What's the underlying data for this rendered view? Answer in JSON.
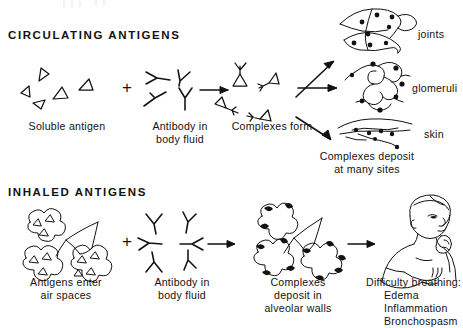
{
  "figure": {
    "ink_color": "#14110f",
    "background": "#ffffff",
    "width": 463,
    "height": 328
  },
  "sections": [
    {
      "id": "circulating",
      "heading": "CIRCULATING ANTIGENS",
      "steps": [
        {
          "id": "soluble-antigen",
          "caption": "Soluble antigen",
          "icon": "triangle-antigen-cluster",
          "count": 5
        },
        {
          "id": "operator-plus",
          "caption": "+",
          "icon": "plus-operator"
        },
        {
          "id": "antibody",
          "caption": "Antibody in\nbody fluid",
          "caption_line1": "Antibody in",
          "caption_line2": "body fluid",
          "icon": "y-antibody-cluster",
          "count": 4
        },
        {
          "id": "complexes",
          "caption": "Complexes form",
          "icon": "antigen-antibody-complex-cluster",
          "count": 4
        }
      ],
      "outcomes": [
        {
          "id": "joints",
          "label": "joints",
          "icon": "joint-space-deposits"
        },
        {
          "id": "glomeruli",
          "label": "glomeruli",
          "icon": "glomerulus-deposits"
        },
        {
          "id": "skin",
          "label": "skin",
          "icon": "skin-vessel-deposits"
        }
      ],
      "outcome_caption_line1": "Complexes deposit",
      "outcome_caption_line2": "at many sites"
    },
    {
      "id": "inhaled",
      "heading": "INHALED ANTIGENS",
      "steps": [
        {
          "id": "antigens-air-spaces",
          "caption_line1": "Antigens enter",
          "caption_line2": "air spaces",
          "icon": "alveoli-with-antigens"
        },
        {
          "id": "operator-plus-2",
          "caption": "+",
          "icon": "plus-operator"
        },
        {
          "id": "antibody-2",
          "caption_line1": "Antibody in",
          "caption_line2": "body fluid",
          "icon": "y-antibody-radial-cluster",
          "count": 6
        },
        {
          "id": "alveolar-deposits",
          "caption_line1": "Complexes",
          "caption_line2": "deposit in",
          "caption_line3": "alveolar walls",
          "icon": "alveoli-with-deposits"
        },
        {
          "id": "symptoms",
          "icon": "coughing-patient"
        }
      ],
      "symptoms": {
        "title": "Difficulty breathing:",
        "items": [
          "Edema",
          "Inflammation",
          "Bronchospasm"
        ]
      }
    }
  ]
}
